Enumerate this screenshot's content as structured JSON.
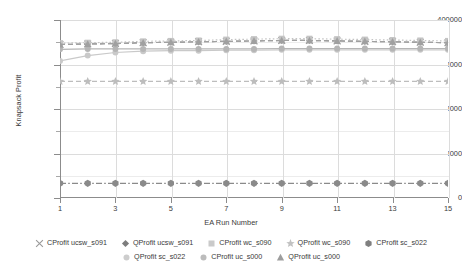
{
  "chart_data": {
    "type": "line",
    "title": "",
    "xlabel": "EA Run Number",
    "ylabel": "Knapsack Profit",
    "x": [
      1,
      2,
      3,
      4,
      5,
      6,
      7,
      8,
      9,
      10,
      11,
      12,
      13,
      14,
      15
    ],
    "xlim": [
      1,
      15
    ],
    "ylim": [
      0,
      400000
    ],
    "xticks": [
      1,
      3,
      5,
      7,
      9,
      11,
      13,
      15
    ],
    "xtick_labels": [
      "1",
      "3",
      "5",
      "7",
      "9",
      "11",
      "13",
      "15"
    ],
    "yticks": [
      0,
      100000,
      200000,
      300000,
      400000
    ],
    "ytick_labels": [
      "0",
      "100000",
      "200000",
      "300000",
      "400000"
    ],
    "yticks_minor": [
      50000,
      150000,
      250000,
      350000
    ],
    "grid": "horizontal-and-vertical",
    "legend_position": "bottom",
    "series": [
      {
        "name": "CProfit ucsw_s091",
        "marker": "x",
        "color": "#9a9a9a",
        "linestyle": "none",
        "values": [
          345000,
          346000,
          347000,
          349000,
          350000,
          351000,
          352000,
          353000,
          354000,
          354000,
          353000,
          352000,
          351000,
          350000,
          349000
        ]
      },
      {
        "name": "QProfit ucsw_s091",
        "marker": "diamond",
        "color": "#8f8f8f",
        "linestyle": "dashed",
        "values": [
          345000,
          346000,
          347000,
          349000,
          350000,
          351000,
          352000,
          353000,
          354000,
          354000,
          353000,
          352000,
          351000,
          350000,
          349000
        ]
      },
      {
        "name": "CProfit wc_s090",
        "marker": "square",
        "color": "#c4c4c4",
        "linestyle": "dotted",
        "values": [
          348000,
          349000,
          350000,
          352000,
          353000,
          354000,
          356000,
          357000,
          358000,
          358000,
          357000,
          356000,
          355000,
          354000,
          353000
        ]
      },
      {
        "name": "QProfit wc_s090",
        "marker": "star",
        "color": "#bdbdbd",
        "linestyle": "dashed",
        "values": [
          262000,
          262000,
          262000,
          262000,
          262000,
          262000,
          262000,
          262000,
          262000,
          262000,
          262000,
          262000,
          262000,
          262000,
          262000
        ]
      },
      {
        "name": "CProfit sc_s022",
        "marker": "hexagon",
        "color": "#8a8a8a",
        "linestyle": "dashdot",
        "values": [
          33000,
          33000,
          33000,
          33000,
          33000,
          33000,
          33000,
          33000,
          33000,
          33000,
          33000,
          33000,
          33000,
          33000,
          33000
        ]
      },
      {
        "name": "QProfit sc_s022",
        "marker": "circle",
        "color": "#c9c9c9",
        "linestyle": "solid",
        "values": [
          308000,
          320000,
          327000,
          330000,
          331000,
          331000,
          332000,
          332000,
          333000,
          333000,
          333000,
          333000,
          333000,
          333000,
          333000
        ]
      },
      {
        "name": "CProfit uc_s000",
        "marker": "circle",
        "color": "#b5b5b5",
        "linestyle": "solid",
        "values": [
          334000,
          335000,
          335000,
          335000,
          335000,
          335000,
          335000,
          335000,
          336000,
          336000,
          336000,
          336000,
          336000,
          336000,
          336000
        ]
      },
      {
        "name": "QProfit uc_s000",
        "marker": "triangle",
        "color": "#a0a0a0",
        "linestyle": "dashed",
        "values": [
          345000,
          346000,
          347000,
          349000,
          350000,
          351000,
          352000,
          353000,
          354000,
          354000,
          353000,
          352000,
          351000,
          350000,
          349000
        ]
      }
    ]
  },
  "axes": {
    "y_title": "Knapsack Profit",
    "x_title": "EA Run Number",
    "y_labels": [
      "400000",
      "300000",
      "200000",
      "100000",
      "0"
    ],
    "x_labels": [
      "1",
      "3",
      "5",
      "7",
      "9",
      "11",
      "13",
      "15"
    ]
  },
  "legend": {
    "rows": [
      [
        {
          "label": "CProfit ucsw_s091",
          "marker": "x-marker-icon",
          "color": "#9a9a9a"
        },
        {
          "label": "QProfit ucsw_s091",
          "marker": "diamond-marker-icon",
          "color": "#7d7d7d"
        },
        {
          "label": "CProfit wc_s090",
          "marker": "square-marker-icon",
          "color": "#cacaca"
        },
        {
          "label": "QProfit wc_s090",
          "marker": "star-marker-icon",
          "color": "#c2c2c2"
        },
        {
          "label": "CProfit sc_s022",
          "marker": "hexagon-marker-icon",
          "color": "#7f7f7f"
        }
      ],
      [
        {
          "label": "QProfit sc_s022",
          "marker": "circle-marker-icon",
          "color": "#cdcdcd"
        },
        {
          "label": "CProfit uc_s000",
          "marker": "circle-marker-icon",
          "color": "#bcbcbc"
        },
        {
          "label": "QProfit uc_s000",
          "marker": "triangle-marker-icon",
          "color": "#9d9d9d"
        }
      ]
    ]
  }
}
